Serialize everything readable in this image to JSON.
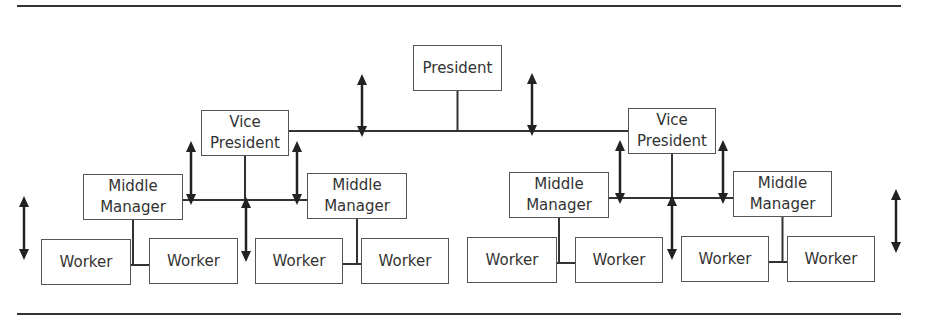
{
  "diagram": {
    "title": "",
    "colors": {
      "line": "#333333",
      "box_border": "#555555",
      "text": "#333333"
    },
    "nodes": [
      {
        "id": "president",
        "label_lines": [
          "President"
        ],
        "x": 413,
        "y": 45,
        "w": 89,
        "h": 46
      },
      {
        "id": "vp_left",
        "label_lines": [
          "Vice",
          "President"
        ],
        "x": 201,
        "y": 110,
        "w": 88,
        "h": 46
      },
      {
        "id": "vp_right",
        "label_lines": [
          "Vice",
          "President"
        ],
        "x": 628,
        "y": 108,
        "w": 88,
        "h": 46
      },
      {
        "id": "mm_1",
        "label_lines": [
          "Middle",
          "Manager"
        ],
        "x": 83,
        "y": 174,
        "w": 100,
        "h": 46
      },
      {
        "id": "mm_2",
        "label_lines": [
          "Middle",
          "Manager"
        ],
        "x": 307,
        "y": 173,
        "w": 100,
        "h": 46
      },
      {
        "id": "mm_3",
        "label_lines": [
          "Middle",
          "Manager"
        ],
        "x": 509,
        "y": 172,
        "w": 100,
        "h": 46
      },
      {
        "id": "mm_4",
        "label_lines": [
          "Middle",
          "Manager"
        ],
        "x": 733,
        "y": 171,
        "w": 99,
        "h": 46
      },
      {
        "id": "w_1",
        "label_lines": [
          "Worker"
        ],
        "x": 41,
        "y": 239,
        "w": 90,
        "h": 46
      },
      {
        "id": "w_2",
        "label_lines": [
          "Worker"
        ],
        "x": 149,
        "y": 238,
        "w": 89,
        "h": 46
      },
      {
        "id": "w_3",
        "label_lines": [
          "Worker"
        ],
        "x": 255,
        "y": 238,
        "w": 88,
        "h": 46
      },
      {
        "id": "w_4",
        "label_lines": [
          "Worker"
        ],
        "x": 361,
        "y": 238,
        "w": 88,
        "h": 46
      },
      {
        "id": "w_5",
        "label_lines": [
          "Worker"
        ],
        "x": 467,
        "y": 237,
        "w": 90,
        "h": 46
      },
      {
        "id": "w_6",
        "label_lines": [
          "Worker"
        ],
        "x": 575,
        "y": 237,
        "w": 88,
        "h": 46
      },
      {
        "id": "w_7",
        "label_lines": [
          "Worker"
        ],
        "x": 681,
        "y": 236,
        "w": 88,
        "h": 46
      },
      {
        "id": "w_8",
        "label_lines": [
          "Worker"
        ],
        "x": 787,
        "y": 236,
        "w": 88,
        "h": 46
      }
    ],
    "edges": [
      {
        "from": "president",
        "to": "vp_left"
      },
      {
        "from": "president",
        "to": "vp_right"
      },
      {
        "from": "vp_left",
        "to": "mm_1"
      },
      {
        "from": "vp_left",
        "to": "mm_2"
      },
      {
        "from": "vp_right",
        "to": "mm_3"
      },
      {
        "from": "vp_right",
        "to": "mm_4"
      },
      {
        "from": "mm_1",
        "to": "w_1"
      },
      {
        "from": "mm_1",
        "to": "w_2"
      },
      {
        "from": "mm_2",
        "to": "w_3"
      },
      {
        "from": "mm_2",
        "to": "w_4"
      },
      {
        "from": "mm_3",
        "to": "w_5"
      },
      {
        "from": "mm_3",
        "to": "w_6"
      },
      {
        "from": "mm_4",
        "to": "w_7"
      },
      {
        "from": "mm_4",
        "to": "w_8"
      }
    ],
    "double_arrows": [
      {
        "id": "arrow-top-left",
        "x": 362,
        "y1": 74,
        "y2": 137
      },
      {
        "id": "arrow-top-right",
        "x": 532,
        "y1": 73,
        "y2": 136
      },
      {
        "id": "arrow-vp-left-a",
        "x": 191,
        "y1": 141,
        "y2": 205
      },
      {
        "id": "arrow-vp-left-b",
        "x": 297,
        "y1": 141,
        "y2": 205
      },
      {
        "id": "arrow-vp-left-c",
        "x": 246,
        "y1": 197,
        "y2": 262
      },
      {
        "id": "arrow-vp-right-a",
        "x": 620,
        "y1": 140,
        "y2": 204
      },
      {
        "id": "arrow-vp-right-b",
        "x": 723,
        "y1": 140,
        "y2": 204
      },
      {
        "id": "arrow-vp-right-c",
        "x": 672,
        "y1": 195,
        "y2": 260
      },
      {
        "id": "arrow-far-left",
        "x": 24,
        "y1": 196,
        "y2": 260
      },
      {
        "id": "arrow-far-right",
        "x": 896,
        "y1": 189,
        "y2": 253
      }
    ]
  }
}
